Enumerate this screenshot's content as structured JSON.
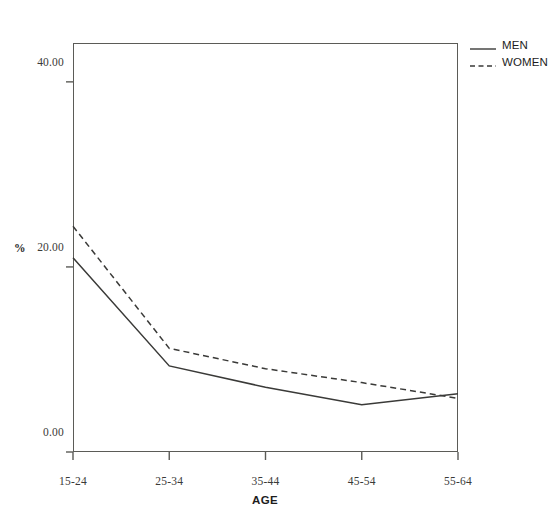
{
  "chart_data": {
    "type": "line",
    "title": "",
    "xlabel": "AGE",
    "ylabel": "%",
    "categories": [
      "15-24",
      "25-34",
      "35-44",
      "45-54",
      "55-64"
    ],
    "ytick_labels": [
      "40.00",
      "20.00",
      "0.00"
    ],
    "ytick_values": [
      40,
      20,
      0
    ],
    "ylim": [
      0,
      44.2
    ],
    "grid": false,
    "legend_position": "top-right-outside",
    "series": [
      {
        "name": "MEN",
        "style": "solid",
        "color": "#3a3a38",
        "values": [
          21.0,
          9.3,
          7.0,
          5.1,
          6.3
        ]
      },
      {
        "name": "WOMEN",
        "style": "dashed",
        "color": "#3a3a38",
        "values": [
          24.4,
          11.2,
          9.0,
          7.5,
          5.8
        ]
      }
    ]
  },
  "legend": {
    "items": [
      {
        "label": "MEN",
        "style": "solid"
      },
      {
        "label": "WOMEN",
        "style": "dashed"
      }
    ]
  },
  "axes": {
    "y_title": "%",
    "x_title": "AGE"
  }
}
